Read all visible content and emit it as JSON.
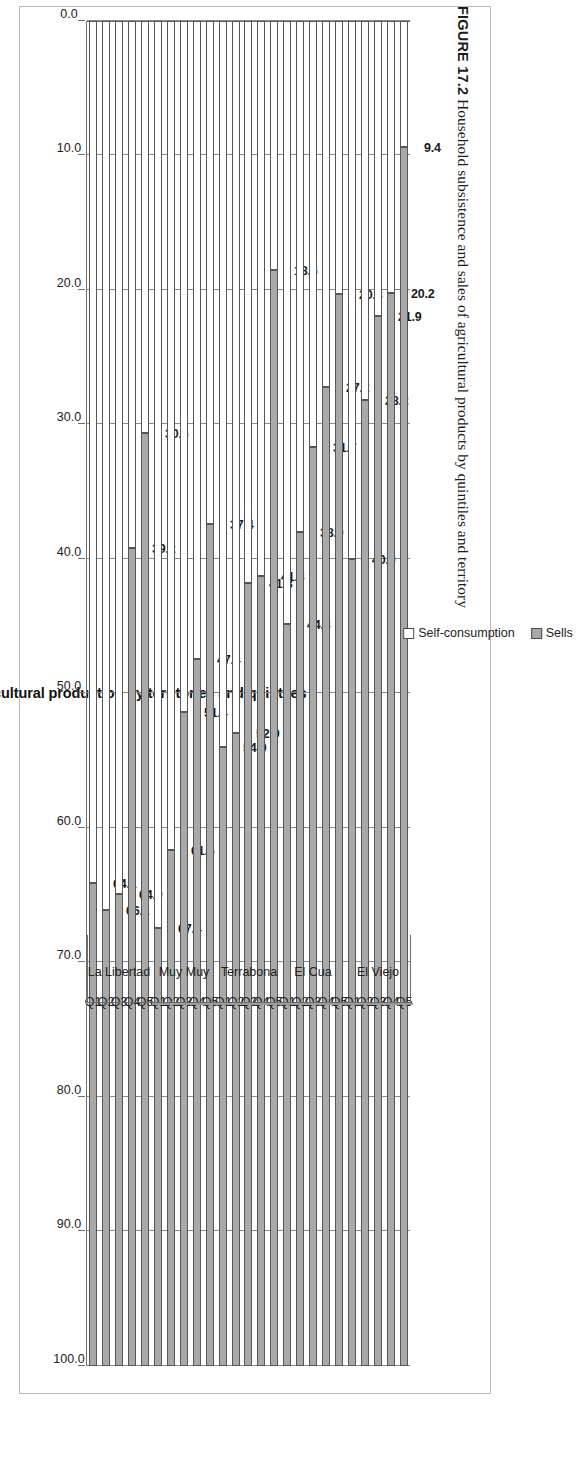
{
  "caption": {
    "figure_number": "FIGURE 17.2",
    "text": "Household subsistence and sales of agricultural products by quintiles and territory"
  },
  "legend": {
    "items": [
      {
        "label": "Self-consumption",
        "color": "#ffffff"
      },
      {
        "label": "Sells",
        "color": "#a9a9a9"
      }
    ]
  },
  "axis": {
    "value_ticks": [
      "100.0",
      "90.0",
      "80.0",
      "70.0",
      "60.0",
      "50.0",
      "40.0",
      "30.0",
      "20.0",
      "10.0",
      "0.0"
    ]
  },
  "chart_data": {
    "type": "bar",
    "orientation": "horizontal-stacked",
    "title": "Self-consumption and sells of agricultural production by territories and quintiles",
    "xlabel": "",
    "ylabel": "",
    "ylim": [
      0,
      100
    ],
    "grid": true,
    "legend_position": "bottom-right",
    "stacked": true,
    "stack_total": 100,
    "value_axis_reversed": true,
    "groups": [
      {
        "name": "La Libertad",
        "categories": [
          "Q1",
          "Q2",
          "Q3",
          "Q4",
          "Q5"
        ],
        "self_consumption": [
          64.1,
          66.1,
          64.9,
          39.2,
          30.6
        ],
        "sells": [
          35.9,
          33.9,
          35.1,
          60.8,
          69.4
        ]
      },
      {
        "name": "Muy Muy",
        "categories": [
          "Q1",
          "Q2",
          "Q3",
          "Q4",
          "Q5"
        ],
        "self_consumption": [
          67.4,
          61.6,
          51.4,
          47.4,
          37.4
        ],
        "sells": [
          32.6,
          38.4,
          48.6,
          52.6,
          62.6
        ]
      },
      {
        "name": "Terrabona",
        "categories": [
          "Q1",
          "Q2",
          "Q3",
          "Q4",
          "Q5"
        ],
        "self_consumption": [
          54.0,
          52.9,
          41.8,
          41.3,
          18.5
        ],
        "sells": [
          46.0,
          47.1,
          58.2,
          58.7,
          81.5
        ]
      },
      {
        "name": "El Cua",
        "categories": [
          "Q1",
          "Q2",
          "Q3",
          "Q4",
          "Q5"
        ],
        "self_consumption": [
          44.8,
          38.0,
          31.7,
          27.2,
          20.3
        ],
        "sells": [
          55.2,
          62.0,
          68.3,
          72.8,
          79.7
        ]
      },
      {
        "name": "El Viejo",
        "categories": [
          "Q1",
          "Q2",
          "Q3",
          "Q4",
          "Q5"
        ],
        "self_consumption": [
          40.0,
          28.2,
          21.9,
          20.2,
          9.4
        ],
        "sells": [
          60.0,
          71.8,
          78.1,
          79.8,
          90.6
        ]
      }
    ],
    "data_labels": [
      "64.1",
      "66.1",
      "64.9",
      "39.2",
      "30.6",
      "67.4",
      "61.6",
      "51.4",
      "47.4",
      "37.4",
      "54.0",
      "52.9",
      "41.8",
      "41.3",
      "18.5",
      "44.8",
      "38.0",
      "31.7",
      "27.2",
      "20.3",
      "40.0",
      "28.2",
      "21.9",
      "20.2",
      "9.4"
    ],
    "colors": {
      "self_consumption": "#ffffff",
      "sells": "#a9a9a9",
      "border": "#565656"
    }
  }
}
